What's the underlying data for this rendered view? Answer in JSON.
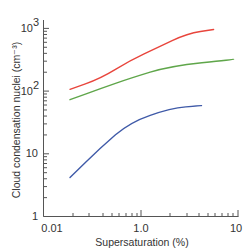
{
  "chart_data": {
    "type": "line",
    "title": "",
    "xlabel": "Supersaturation (%)",
    "ylabel": "Cloud condensation nuclei (cm⁻³)",
    "xscale": "log",
    "yscale": "log",
    "x_tick_labels": [
      "0.01",
      "1.0",
      "10"
    ],
    "y_tick_labels": [
      "1",
      "10",
      "10²",
      "10³"
    ],
    "ylim": [
      1,
      1000
    ],
    "grid": false,
    "legend": null,
    "series": [
      {
        "name": "red",
        "color": "#e8453c",
        "x": [
          0.035,
          0.15,
          0.6,
          1.5,
          3.0,
          5.6
        ],
        "y": [
          107,
          160,
          310,
          500,
          830,
          960
        ]
      },
      {
        "name": "green",
        "color": "#5fa64a",
        "x": [
          0.035,
          0.15,
          0.6,
          2.0,
          9.0
        ],
        "y": [
          73,
          110,
          160,
          250,
          320
        ]
      },
      {
        "name": "blue",
        "color": "#3f5aa8",
        "x": [
          0.035,
          0.15,
          0.6,
          2.0,
          4.2
        ],
        "y": [
          4.2,
          12.6,
          32,
          53,
          59
        ]
      }
    ]
  },
  "axes": {
    "x_title": "Supersaturation (%)",
    "y_title": "Cloud condensation nuclei (cm⁻³)",
    "x_labels": [
      "0.01",
      "1.0",
      "10"
    ],
    "y_labels": [
      "1",
      "10",
      "10",
      "10"
    ],
    "y_label_exponents": [
      "",
      "",
      "2",
      "3"
    ]
  }
}
